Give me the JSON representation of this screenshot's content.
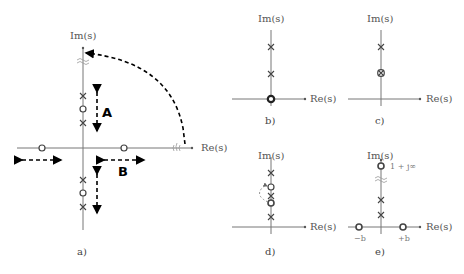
{
  "figure": {
    "panels": [
      {
        "id": "a",
        "caption": "a)",
        "im_label": "Im(s)",
        "re_label": "Re(s)",
        "region_labels": [
          "A",
          "B"
        ],
        "elements": {
          "poles_upper": 2,
          "zero_upper": 1,
          "poles_lower": 2,
          "zero_lower": 1,
          "zeros_real_axis": 2,
          "arrows": [
            "vertical dashed double arrow A (upper)",
            "vertical dashed double arrow (lower)",
            "horizontal dashed double arrow left",
            "horizontal dashed double arrow B",
            "dashed arc from +Re infinity to +Im infinity"
          ]
        }
      },
      {
        "id": "b",
        "caption": "b)",
        "im_label": "Im(s)",
        "re_label": "Re(s)",
        "elements": {
          "poles_imag_axis": 2,
          "zero_at_origin": "double/bold"
        }
      },
      {
        "id": "c",
        "caption": "c)",
        "im_label": "Im(s)",
        "re_label": "Re(s)",
        "elements": {
          "poles_imag_axis": 2,
          "pole_zero_cancellation": 1
        }
      },
      {
        "id": "d",
        "caption": "d)",
        "im_label": "Im(s)",
        "re_label": "Re(s)",
        "elements": {
          "poles_imag_axis": 3,
          "zeros_imag_axis": 2,
          "dashed_arc": "zero moves past pole"
        }
      },
      {
        "id": "e",
        "caption": "e)",
        "im_label": "Im(s)",
        "re_label": "Re(s)",
        "annotation": "1 + j∞",
        "neg_label": "−b",
        "pos_label": "+b",
        "elements": {
          "poles_imag_axis": 2,
          "zero_at_infinity": 1,
          "zeros_real_axis": 2
        }
      }
    ]
  }
}
